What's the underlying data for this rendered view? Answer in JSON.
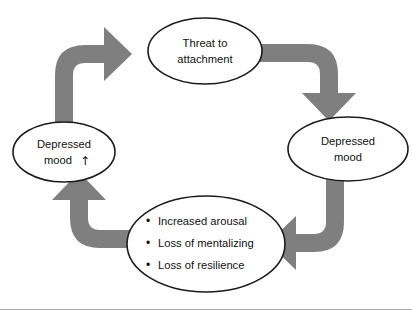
{
  "figure": {
    "background_color": "#ffffff",
    "arrow_color": "#7f7f7f",
    "node_fill_color": "#ffffff",
    "node_stroke_color": "#1b1b1b",
    "rule_color": "#a8a8a8"
  },
  "nodes": {
    "threat": {
      "id": "threat-to-attachment",
      "line1": "Threat to",
      "line2": "attachment"
    },
    "depressed_mood": {
      "id": "depressed-mood",
      "line1": "Depressed",
      "line2": "mood"
    },
    "symptoms": {
      "id": "symptoms-list",
      "bullet_glyph": "•",
      "items": [
        "Increased arousal",
        "Loss of mentalizing",
        "Loss of resilience"
      ]
    },
    "depressed_mood_increased": {
      "id": "depressed-mood-increased",
      "line1": "Depressed",
      "line2": "mood",
      "up_arrow_glyph": "↑"
    }
  },
  "arrows": [
    {
      "id": "arrow-symptoms-to-depressed-mood-increased",
      "from": "symptoms-list",
      "to": "depressed-mood-increased",
      "direction": "up"
    },
    {
      "id": "arrow-depressed-mood-increased-to-threat",
      "from": "depressed-mood-increased",
      "to": "threat-to-attachment",
      "direction": "right"
    },
    {
      "id": "arrow-threat-to-depressed-mood",
      "from": "threat-to-attachment",
      "to": "depressed-mood",
      "direction": "down"
    },
    {
      "id": "arrow-depressed-mood-to-symptoms",
      "from": "depressed-mood",
      "to": "symptoms-list",
      "direction": "left"
    }
  ]
}
